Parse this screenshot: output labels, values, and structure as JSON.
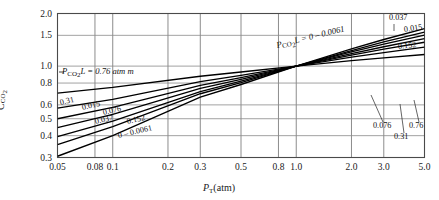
{
  "chart_data": {
    "type": "line",
    "title": "",
    "xlabel": "P_T(atm)",
    "ylabel": "C_CO2",
    "xscale": "log",
    "yscale": "log",
    "xlim": [
      0.05,
      5.0
    ],
    "ylim": [
      0.3,
      2.0
    ],
    "grid": true,
    "legend_position": "inline-labels",
    "xticks": [
      "0.05",
      "0.08",
      "0.1",
      "0.2",
      "0.3",
      "0.5",
      "0.8",
      "1.0",
      "2.0",
      "3.0",
      "5.0"
    ],
    "xtick_values": [
      0.05,
      0.08,
      0.1,
      0.2,
      0.3,
      0.5,
      0.8,
      1.0,
      2.0,
      3.0,
      5.0
    ],
    "yticks": [
      "0.3",
      "0.4",
      "0.5",
      "0.6",
      "0.8",
      "1.0",
      "1.5",
      "2.0"
    ],
    "ytick_values": [
      0.3,
      0.4,
      0.5,
      0.6,
      0.8,
      1.0,
      1.5,
      2.0
    ],
    "convergence_point": [
      1.0,
      1.0
    ],
    "series": [
      {
        "name": "0.76",
        "label_left": "",
        "label_right": "0.76",
        "x": [
          0.05,
          0.1,
          0.3,
          0.5,
          1.0,
          2.0,
          3.0,
          5.0
        ],
        "values": [
          0.7,
          0.755,
          0.875,
          0.925,
          1.0,
          1.075,
          1.115,
          1.165
        ]
      },
      {
        "name": "0.31",
        "label_left": "0.31",
        "label_right": "0.31",
        "x": [
          0.05,
          0.1,
          0.3,
          0.5,
          1.0,
          2.0,
          3.0,
          5.0
        ],
        "values": [
          0.575,
          0.645,
          0.815,
          0.885,
          1.0,
          1.125,
          1.195,
          1.285
        ]
      },
      {
        "name": "0.152",
        "label_left": "0.152",
        "label_right": "0.152",
        "x": [
          0.05,
          0.1,
          0.3,
          0.5,
          1.0,
          2.0,
          3.0,
          5.0
        ],
        "values": [
          0.5,
          0.58,
          0.775,
          0.86,
          1.0,
          1.155,
          1.25,
          1.37
        ]
      },
      {
        "name": "0.076",
        "label_left": "0.076",
        "label_right": "0.076",
        "x": [
          0.05,
          0.1,
          0.3,
          0.5,
          1.0,
          2.0,
          3.0,
          5.0
        ],
        "values": [
          0.445,
          0.53,
          0.745,
          0.84,
          1.0,
          1.18,
          1.29,
          1.435
        ]
      },
      {
        "name": "0.037",
        "label_left": "0.037",
        "label_right": "0.037",
        "x": [
          0.05,
          0.1,
          0.3,
          0.5,
          1.0,
          2.0,
          3.0,
          5.0
        ],
        "values": [
          0.395,
          0.485,
          0.715,
          0.82,
          1.0,
          1.205,
          1.335,
          1.505
        ]
      },
      {
        "name": "0.015",
        "label_left": "0.015",
        "label_right": "0.015",
        "x": [
          0.05,
          0.1,
          0.3,
          0.5,
          1.0,
          2.0,
          3.0,
          5.0
        ],
        "values": [
          0.355,
          0.45,
          0.695,
          0.805,
          1.0,
          1.225,
          1.375,
          1.565
        ]
      },
      {
        "name": "0 – 0.0061",
        "label_left": "0.0061",
        "label_right": "",
        "x": [
          0.05,
          0.1,
          0.3,
          0.5,
          1.0,
          2.0,
          3.0,
          5.0
        ],
        "values": [
          0.305,
          0.4,
          0.665,
          0.785,
          1.0,
          1.255,
          1.42,
          1.64
        ]
      }
    ],
    "annotations": [
      {
        "id": "left-annotation",
        "text_main": "P",
        "text_sub": "CO",
        "text_sub2": "2",
        "text_rest": "L = 0.76 atm m"
      },
      {
        "id": "right-annotation",
        "text_main": "P",
        "text_sub": "CO",
        "text_sub2": "2",
        "text_rest": "L = 0 – 0.0061"
      }
    ]
  },
  "labels": {
    "xaxis_p": "P",
    "xaxis_t": "T",
    "xaxis_unit": "(atm)",
    "yaxis_c": "C",
    "yaxis_sub": "CO",
    "yaxis_sub2": "2",
    "annot_left_rest": "L = 0.76 atm m",
    "annot_right_rest": "L = 0 – 0.0061",
    "p_sym": "P",
    "co": "CO",
    "two": "2"
  },
  "inline_labels": {
    "left": [
      "0.31",
      "0.015",
      "0.076",
      "0.037",
      "0.152",
      "0.0061"
    ],
    "left_zero_prefix": "0 –",
    "right_upper": [
      "0.037",
      "0.015",
      "0.152"
    ],
    "right_lower": [
      "0.076",
      "0.31",
      "0.76"
    ]
  }
}
